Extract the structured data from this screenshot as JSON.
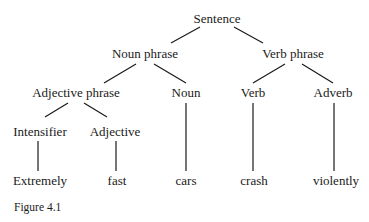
{
  "figure": {
    "caption": "Figure 4.1",
    "tree": {
      "root": "Sentence",
      "nodes": [
        {
          "id": "s",
          "label": "Sentence",
          "x": 217,
          "y": 12
        },
        {
          "id": "np",
          "label": "Noun phrase",
          "x": 145,
          "y": 47
        },
        {
          "id": "vp",
          "label": "Verb phrase",
          "x": 293,
          "y": 47
        },
        {
          "id": "adjp",
          "label": "Adjective phrase",
          "x": 76,
          "y": 86
        },
        {
          "id": "n",
          "label": "Noun",
          "x": 186,
          "y": 86
        },
        {
          "id": "v",
          "label": "Verb",
          "x": 253,
          "y": 86
        },
        {
          "id": "adv",
          "label": "Adverb",
          "x": 333,
          "y": 86
        },
        {
          "id": "int",
          "label": "Intensifier",
          "x": 40,
          "y": 125
        },
        {
          "id": "adj",
          "label": "Adjective",
          "x": 115,
          "y": 125
        },
        {
          "id": "w1",
          "label": "Extremely",
          "x": 40,
          "y": 174
        },
        {
          "id": "w2",
          "label": "fast",
          "x": 117,
          "y": 174
        },
        {
          "id": "w3",
          "label": "cars",
          "x": 186,
          "y": 174
        },
        {
          "id": "w4",
          "label": "crash",
          "x": 254,
          "y": 174
        },
        {
          "id": "w5",
          "label": "violently",
          "x": 336,
          "y": 174
        }
      ],
      "edges": [
        {
          "from": "s",
          "to": "np",
          "x1": 200,
          "y1": 27,
          "x2": 171,
          "y2": 43
        },
        {
          "from": "s",
          "to": "vp",
          "x1": 234,
          "y1": 27,
          "x2": 263,
          "y2": 43
        },
        {
          "from": "np",
          "to": "adjp",
          "x1": 136,
          "y1": 64,
          "x2": 104,
          "y2": 83
        },
        {
          "from": "np",
          "to": "n",
          "x1": 154,
          "y1": 64,
          "x2": 186,
          "y2": 83
        },
        {
          "from": "vp",
          "to": "v",
          "x1": 285,
          "y1": 64,
          "x2": 253,
          "y2": 83
        },
        {
          "from": "vp",
          "to": "adv",
          "x1": 302,
          "y1": 64,
          "x2": 333,
          "y2": 83
        },
        {
          "from": "adjp",
          "to": "int",
          "x1": 68,
          "y1": 103,
          "x2": 45,
          "y2": 117
        },
        {
          "from": "adjp",
          "to": "adj",
          "x1": 84,
          "y1": 103,
          "x2": 107,
          "y2": 117
        },
        {
          "from": "int",
          "to": "w1",
          "x1": 38,
          "y1": 141,
          "x2": 38,
          "y2": 171
        },
        {
          "from": "adj",
          "to": "w2",
          "x1": 116,
          "y1": 141,
          "x2": 116,
          "y2": 171
        },
        {
          "from": "n",
          "to": "w3",
          "x1": 186,
          "y1": 103,
          "x2": 186,
          "y2": 171
        },
        {
          "from": "v",
          "to": "w4",
          "x1": 253,
          "y1": 103,
          "x2": 253,
          "y2": 171
        },
        {
          "from": "adv",
          "to": "w5",
          "x1": 334,
          "y1": 103,
          "x2": 334,
          "y2": 171
        }
      ]
    }
  }
}
